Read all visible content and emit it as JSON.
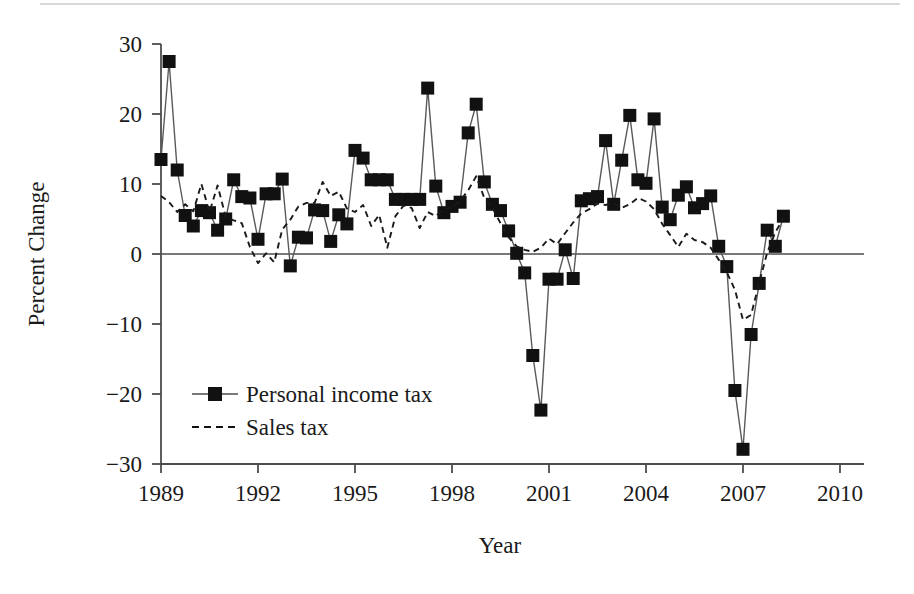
{
  "chart_data": {
    "type": "line",
    "title": "",
    "subtitle": "",
    "xlabel": "Year",
    "ylabel": "Percent Change",
    "xlim": [
      1989,
      2010.75
    ],
    "ylim": [
      -30,
      30
    ],
    "x_ticks": [
      "1989",
      "1992",
      "1995",
      "1998",
      "2001",
      "2004",
      "2007",
      "2010"
    ],
    "x_tick_values": [
      1989,
      1992,
      1995,
      1998,
      2001,
      2004,
      2007,
      2010
    ],
    "y_ticks": [
      "30",
      "20",
      "10",
      "0",
      "−10",
      "−20",
      "−30"
    ],
    "y_tick_values": [
      30,
      20,
      10,
      0,
      -10,
      -20,
      -30
    ],
    "grid": false,
    "zero_line": true,
    "legend_position": "inside-lower-left",
    "frequency": "quarterly",
    "x_start": 1989.0,
    "x_step": 0.25,
    "series": [
      {
        "name": "Personal income tax",
        "style": "solid",
        "marker": "square",
        "color": "#1a1a1a",
        "values": [
          13.5,
          27.5,
          12.0,
          5.5,
          4.0,
          6.2,
          5.9,
          3.4,
          5.0,
          10.6,
          8.2,
          8.0,
          2.1,
          8.6,
          8.6,
          10.7,
          -1.7,
          2.4,
          2.3,
          6.3,
          6.2,
          1.8,
          5.6,
          4.3,
          14.8,
          13.7,
          10.6,
          10.6,
          10.6,
          7.8,
          7.8,
          7.8,
          7.8,
          23.7,
          9.7,
          5.9,
          6.8,
          7.4,
          17.3,
          21.4,
          10.3,
          7.1,
          6.2,
          3.3,
          0.1,
          -2.7,
          -14.5,
          -22.3,
          -3.6,
          -3.6,
          0.6,
          -3.5,
          7.6,
          7.9,
          8.2,
          16.2,
          7.1,
          13.4,
          19.8,
          10.6,
          10.1,
          19.3,
          6.7,
          4.9,
          8.4,
          9.6,
          6.6,
          7.2,
          8.3,
          1.1,
          -1.8,
          -19.5,
          -27.9,
          -11.5,
          -4.2,
          3.4,
          1.1,
          5.4
        ]
      },
      {
        "name": "Sales tax",
        "style": "dashed",
        "marker": "none",
        "color": "#1a1a1a",
        "values": [
          8.3,
          7.4,
          6.0,
          7.1,
          6.1,
          10.0,
          6.0,
          9.8,
          5.3,
          4.8,
          4.4,
          1.0,
          -1.3,
          0.1,
          -1.2,
          3.5,
          4.9,
          6.8,
          7.3,
          7.3,
          10.3,
          8.3,
          8.9,
          6.5,
          6.0,
          7.0,
          4.0,
          5.6,
          0.9,
          5.4,
          6.9,
          6.6,
          3.7,
          6.0,
          5.4,
          6.5,
          6.6,
          7.6,
          9.1,
          11.1,
          8.0,
          6.6,
          4.4,
          2.4,
          1.1,
          0.6,
          0.3,
          0.9,
          2.2,
          1.4,
          3.0,
          4.5,
          5.8,
          6.4,
          7.2,
          7.0,
          7.3,
          6.6,
          7.1,
          8.0,
          7.5,
          6.4,
          4.3,
          2.7,
          1.0,
          2.9,
          2.0,
          1.7,
          0.9,
          -0.8,
          -2.6,
          -5.1,
          -9.4,
          -8.7,
          -4.1,
          0.2,
          3.1,
          5.1
        ]
      }
    ]
  },
  "axes": {
    "y_label": "Percent Change",
    "x_label": "Year"
  },
  "legend": {
    "items": [
      {
        "label": "Personal income tax",
        "style": "solid-square"
      },
      {
        "label": "Sales tax",
        "style": "dashed"
      }
    ]
  }
}
